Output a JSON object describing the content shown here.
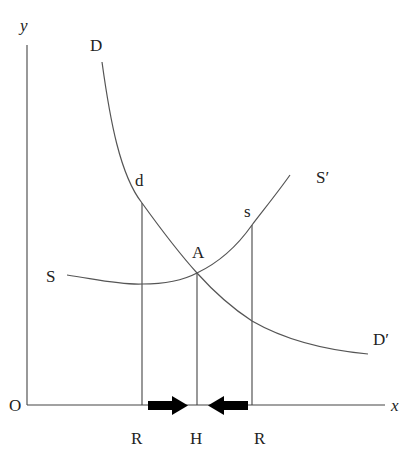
{
  "diagram": {
    "type": "supply-demand",
    "axes": {
      "origin_label": "O",
      "x_label": "x",
      "y_label": "y"
    },
    "curves": {
      "demand": {
        "start_label": "D",
        "end_label": "D′",
        "point_label": "d"
      },
      "supply": {
        "start_label": "S",
        "end_label": "S′",
        "point_label": "s"
      }
    },
    "equilibrium_label": "A",
    "x_axis_marks": [
      "R",
      "H",
      "R"
    ],
    "arrows": [
      {
        "direction": "right",
        "meaning": "toward H"
      },
      {
        "direction": "left",
        "meaning": "toward H"
      }
    ],
    "colors": {
      "line": "#444444",
      "arrow": "#000000",
      "background": "#ffffff"
    }
  }
}
